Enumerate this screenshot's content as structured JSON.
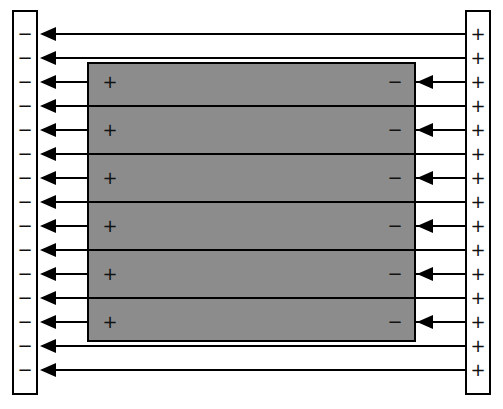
{
  "diagram": {
    "left_plate": {
      "sign": "−",
      "count": 15,
      "color": "#ffffff"
    },
    "right_plate": {
      "sign": "+",
      "count": 15,
      "color": "#ffffff"
    },
    "conductor": {
      "fill": "#8c8c8c",
      "left_sign": "+",
      "right_sign": "−",
      "charge_rows": 6
    },
    "field_lines": {
      "count": 15,
      "direction": "right-to-left"
    },
    "rows_y": [
      34,
      58,
      82,
      106,
      130,
      154,
      178,
      202,
      226,
      250,
      274,
      298,
      322,
      346,
      370
    ]
  }
}
